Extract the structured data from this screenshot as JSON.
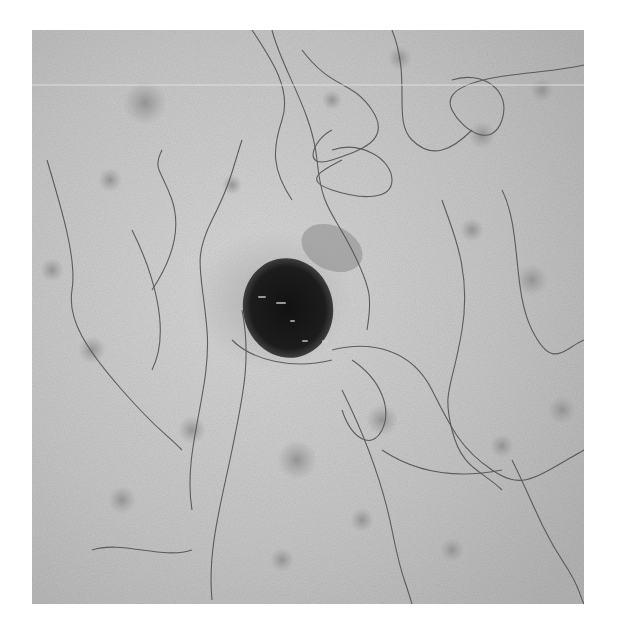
{
  "image": {
    "description": "Grayscale dermoscopic close-up of skin with a dark pigmented lesion at center, surrounded by fine curly hairs and scattered faint spots",
    "colors": {
      "page_background": "#ffffff",
      "skin": "#c4c4c4",
      "skin_light": "#d6d6d6",
      "lesion_core": "#161616",
      "lesion_edge": "#3a3a3a",
      "spot": "#9a9a9a",
      "hair": "#4a4a4a"
    }
  }
}
